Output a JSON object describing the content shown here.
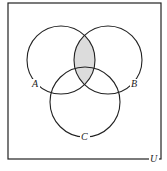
{
  "diagram": {
    "type": "venn",
    "sets": [
      {
        "label": "A",
        "cx": 61,
        "cy": 60,
        "r": 34,
        "label_x": 36,
        "label_y": 87
      },
      {
        "label": "B",
        "cx": 108,
        "cy": 60,
        "r": 34,
        "label_x": 134,
        "label_y": 87
      },
      {
        "label": "C",
        "cx": 85,
        "cy": 102,
        "r": 35,
        "label_x": 85,
        "label_y": 140
      }
    ],
    "universe": {
      "label": "U",
      "x": 8,
      "y": 3,
      "width": 153,
      "height": 156,
      "label_x": 153,
      "label_y": 162
    },
    "shaded_region": "A ∩ B",
    "colors": {
      "stroke": "#222222",
      "shade": "#dcdcdc",
      "background": "#ffffff"
    }
  }
}
